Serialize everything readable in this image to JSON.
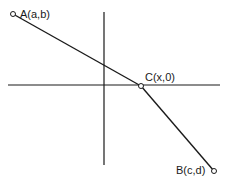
{
  "diagram": {
    "type": "coordinate-geometry",
    "colors": {
      "stroke": "#1a1a1a",
      "background": "#ffffff"
    },
    "axes": {
      "x_axis": {
        "x1": 8,
        "y1": 85,
        "x2": 220,
        "y2": 85
      },
      "y_axis": {
        "x1": 104,
        "y1": 12,
        "x2": 104,
        "y2": 165
      }
    },
    "points": [
      {
        "id": "A",
        "label": "A(a,b)",
        "x": 13,
        "y": 14,
        "label_x": 20,
        "label_y": 18
      },
      {
        "id": "C",
        "label": "C(x,0)",
        "x": 141,
        "y": 86,
        "label_x": 145,
        "label_y": 81
      },
      {
        "id": "B",
        "label": "B(c,d)",
        "x": 214,
        "y": 171,
        "label_x": 176,
        "label_y": 174
      }
    ],
    "segments": [
      {
        "from": "A",
        "to": "C"
      },
      {
        "from": "C",
        "to": "B"
      }
    ]
  }
}
